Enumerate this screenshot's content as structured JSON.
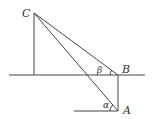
{
  "diagram": {
    "type": "geometry-angles-of-elevation",
    "points": {
      "C": {
        "label": "C",
        "x": 34,
        "y": 13
      },
      "B": {
        "label": "B",
        "x": 118,
        "y": 75
      },
      "A": {
        "label": "A",
        "x": 118,
        "y": 111
      },
      "C_foot": {
        "x": 34,
        "y": 75
      }
    },
    "angles": {
      "beta": {
        "label": "β",
        "vertex": "B"
      },
      "alpha": {
        "label": "α",
        "vertex": "A"
      }
    },
    "lines": [
      {
        "name": "ground-line-upper",
        "from": [
          9,
          75
        ],
        "to": [
          145,
          75
        ]
      },
      {
        "name": "ground-line-lower",
        "from": [
          74,
          111
        ],
        "to": [
          118,
          111
        ]
      },
      {
        "name": "vertical-CD",
        "from": [
          34,
          13
        ],
        "to": [
          34,
          75
        ]
      },
      {
        "name": "vertical-AB",
        "from": [
          118,
          75
        ],
        "to": [
          118,
          111
        ]
      },
      {
        "name": "segment-CB",
        "from": [
          34,
          13
        ],
        "to": [
          118,
          75
        ]
      },
      {
        "name": "segment-CA",
        "from": [
          34,
          13
        ],
        "to": [
          118,
          111
        ]
      }
    ],
    "colors": {
      "stroke": "#444444",
      "text": "#333333",
      "background": "#ffffff"
    }
  }
}
